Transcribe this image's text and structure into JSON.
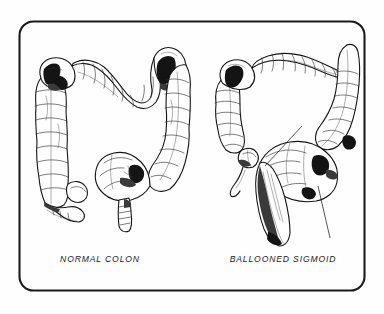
{
  "figure": {
    "background_color": "#fefefe",
    "ink_color": "#161616",
    "frame": {
      "style": "rounded-rectangle",
      "stroke_color": "#1b1b1b",
      "x": 19,
      "y": 21,
      "width": 346,
      "height": 270,
      "corner_radius": 14
    },
    "panels": [
      {
        "id": "normal-colon",
        "caption": "NORMAL COLON",
        "caption_x": 100,
        "caption_y": 262,
        "structures": [
          "ascending colon",
          "hepatic flexure",
          "transverse colon",
          "splenic flexure",
          "descending colon",
          "sigmoid colon",
          "rectum",
          "cecum",
          "appendix"
        ],
        "haustral_segments": 34,
        "shaded_flexures": 2
      },
      {
        "id": "ballooned-sigmoid",
        "caption": "BALLOONED SIGMOID",
        "caption_x": 283,
        "caption_y": 262,
        "structures": [
          "ascending colon",
          "hepatic flexure",
          "transverse colon",
          "splenic flexure",
          "descending colon",
          "ballooned sigmoid loop",
          "dilated rectum",
          "cecum",
          "appendix"
        ],
        "haustral_segments": 38,
        "shaded_flexures": 1,
        "leaders": [
          {
            "name": "leader-to-sigmoid-dome",
            "x1": 302,
            "y1": 126,
            "x2": 265,
            "y2": 166
          },
          {
            "name": "leader-to-rectosigmoid",
            "x1": 318,
            "y1": 186,
            "x2": 330,
            "y2": 238
          }
        ]
      }
    ]
  }
}
